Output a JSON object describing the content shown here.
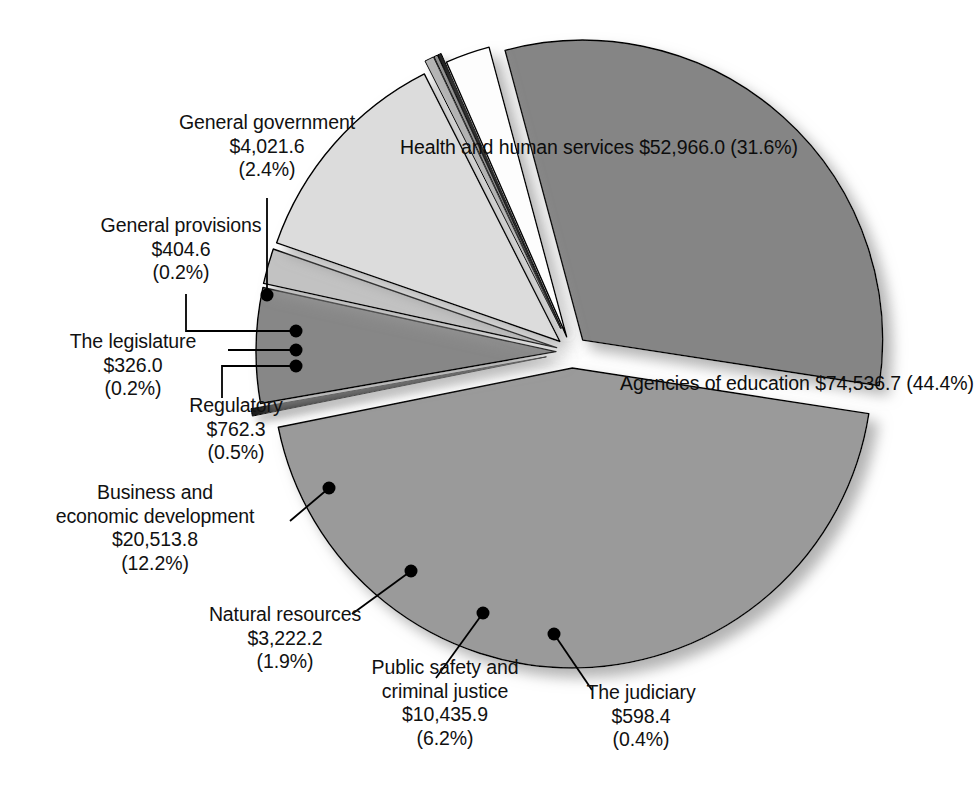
{
  "chart_data": {
    "type": "pie",
    "title": "",
    "subtitle": "",
    "units": "millions of dollars",
    "legend_position": "none",
    "grid": false,
    "total_percent": "100.0%",
    "categories": [
      "Health and human services",
      "Agencies of education",
      "The judiciary",
      "Public safety and criminal justice",
      "Natural resources",
      "Business and economic development",
      "Regulatory",
      "The legislature",
      "General provisions",
      "General government"
    ],
    "values": [
      52966.0,
      74536.7,
      598.4,
      10435.9,
      3222.2,
      20513.8,
      762.3,
      326.0,
      404.6,
      4021.6
    ],
    "percents": [
      31.6,
      44.4,
      0.4,
      6.2,
      1.9,
      12.2,
      0.5,
      0.2,
      0.2,
      2.4
    ],
    "colors": [
      "#858585",
      "#9a9a9a",
      "#1a1a1a",
      "#878787",
      "#c2c2c2",
      "#dcdcdc",
      "#b5b5b5",
      "#8f8f8f",
      "#222222",
      "#fdfdfd"
    ],
    "slices": [
      {
        "key": "health",
        "name": "Health and human services",
        "value": 52966.0,
        "value_label": "$52,966.0",
        "percent": 31.6,
        "percent_label": "(31.6%)",
        "color": "#858585",
        "label_placement": "inside"
      },
      {
        "key": "education",
        "name": "Agencies of education",
        "value": 74536.7,
        "value_label": "$74,536.7",
        "percent": 44.4,
        "percent_label": "(44.4%)",
        "color": "#9a9a9a",
        "label_placement": "inside"
      },
      {
        "key": "judiciary",
        "name": "The judiciary",
        "value": 598.4,
        "value_label": "$598.4",
        "percent": 0.4,
        "percent_label": "(0.4%)",
        "color": "#1a1a1a",
        "label_placement": "callout"
      },
      {
        "key": "public-safety",
        "name": "Public safety and criminal justice",
        "name_line1": "Public safety and",
        "name_line2": "criminal justice",
        "value": 10435.9,
        "value_label": "$10,435.9",
        "percent": 6.2,
        "percent_label": "(6.2%)",
        "color": "#878787",
        "label_placement": "callout"
      },
      {
        "key": "natural-resources",
        "name": "Natural resources",
        "value": 3222.2,
        "value_label": "$3,222.2",
        "percent": 1.9,
        "percent_label": "(1.9%)",
        "color": "#c2c2c2",
        "label_placement": "callout"
      },
      {
        "key": "business",
        "name": "Business and economic development",
        "name_line1": "Business and",
        "name_line2": "economic development",
        "value": 20513.8,
        "value_label": "$20,513.8",
        "percent": 12.2,
        "percent_label": "(12.2%)",
        "color": "#dcdcdc",
        "label_placement": "callout"
      },
      {
        "key": "regulatory",
        "name": "Regulatory",
        "value": 762.3,
        "value_label": "$762.3",
        "percent": 0.5,
        "percent_label": "(0.5%)",
        "color": "#b5b5b5",
        "label_placement": "callout"
      },
      {
        "key": "legislature",
        "name": "The legislature",
        "value": 326.0,
        "value_label": "$326.0",
        "percent": 0.2,
        "percent_label": "(0.2%)",
        "color": "#8f8f8f",
        "label_placement": "callout"
      },
      {
        "key": "general-provisions",
        "name": "General provisions",
        "value": 404.6,
        "value_label": "$404.6",
        "percent": 0.2,
        "percent_label": "(0.2%)",
        "color": "#222222",
        "label_placement": "callout"
      },
      {
        "key": "general-government",
        "name": "General government",
        "value": 4021.6,
        "value_label": "$4,021.6",
        "percent": 2.4,
        "percent_label": "(2.4%)",
        "color": "#fdfdfd",
        "label_placement": "callout"
      }
    ]
  },
  "slice_labels": {
    "health": {
      "line1": "Health and human",
      "line2": "services $52,966.0",
      "line3": "(31.6%)"
    },
    "education": {
      "line1": "Agencies of education",
      "line2": "$74,536.7",
      "line3": "(44.4%)"
    }
  },
  "callouts": {
    "general_government": {
      "line1": "General government",
      "line2": "$4,021.6",
      "line3": "(2.4%)"
    },
    "general_provisions": {
      "line1": "General provisions",
      "line2": "$404.6",
      "line3": "(0.2%)"
    },
    "the_legislature": {
      "line1": "The legislature",
      "line2": "$326.0",
      "line3": "(0.2%)"
    },
    "regulatory": {
      "line1": "Regulatory",
      "line2": "$762.3",
      "line3": "(0.5%)"
    },
    "business": {
      "line1": "Business and",
      "line2": "economic development",
      "line3": "$20,513.8",
      "line4": "(12.2%)"
    },
    "natural_resources": {
      "line1": "Natural resources",
      "line2": "$3,222.2",
      "line3": "(1.9%)"
    },
    "public_safety": {
      "line1": "Public safety and",
      "line2": "criminal justice",
      "line3": "$10,435.9",
      "line4": "(6.2%)"
    },
    "the_judiciary": {
      "line1": "The judiciary",
      "line2": "$598.4",
      "line3": "(0.4%)"
    }
  },
  "style": {
    "background": "#ffffff",
    "text_color": "#111111",
    "outline_color": "#000000",
    "shadow_color": "#b8b8b8"
  }
}
